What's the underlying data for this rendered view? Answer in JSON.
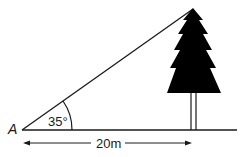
{
  "diagram": {
    "point_label": "A",
    "angle_label": "35°",
    "distance_label": "20m",
    "colors": {
      "stroke": "#1a1a1a",
      "tree": "#000000",
      "background": "#ffffff"
    }
  }
}
